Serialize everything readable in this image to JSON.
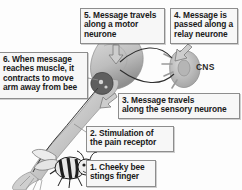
{
  "diagram": {
    "background_color": "#ffffff",
    "box_fill": "#f7f7f7",
    "box_border": "#8d8d8d",
    "text_color": "#1a1a1a",
    "art_gray_light": "#d9d9d9",
    "art_gray_mid": "#b0b0b0",
    "art_gray_dark": "#6e6e6e"
  },
  "labels": {
    "cns": "CNS"
  },
  "callouts": [
    {
      "id": "step-5",
      "lines": [
        "5. Message travels",
        "along a motor",
        "neurone"
      ]
    },
    {
      "id": "step-4",
      "lines": [
        "4. Message is",
        "passed along a",
        "relay neurone"
      ]
    },
    {
      "id": "step-6",
      "lines": [
        "6. When message",
        "reaches muscle, it",
        "contracts to move",
        "arm away from bee"
      ]
    },
    {
      "id": "step-3",
      "lines": [
        "3. Message travels",
        "along the sensory neurone"
      ]
    },
    {
      "id": "step-2",
      "lines": [
        "2. Stimulation of",
        "the pain receptor"
      ]
    },
    {
      "id": "step-1",
      "lines": [
        "1. Cheeky bee",
        "stings finger"
      ]
    }
  ]
}
